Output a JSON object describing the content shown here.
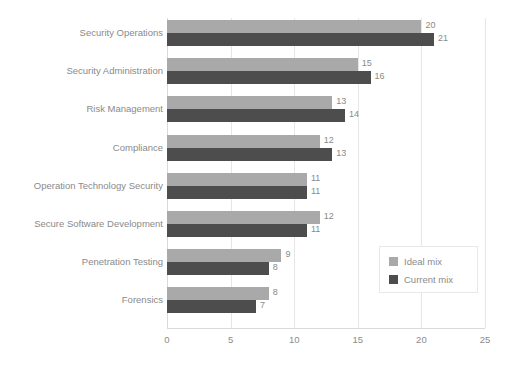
{
  "chart_data": {
    "type": "bar",
    "orientation": "horizontal",
    "title": "",
    "subtitle": "",
    "xlabel": "",
    "ylabel": "",
    "xlim": [
      0,
      25
    ],
    "xticks": [
      "0",
      "5",
      "10",
      "15",
      "20",
      "25"
    ],
    "grid": true,
    "legend_position": "center-right",
    "categories": [
      "Security Operations",
      "Security Administration",
      "Risk Management",
      "Compliance",
      "Operation Technology Security",
      "Secure Software Development",
      "Penetration Testing",
      "Forensics"
    ],
    "series": [
      {
        "name": "Ideal mix",
        "color": "#a9a9a9",
        "values": [
          20,
          15,
          13,
          12,
          11,
          12,
          9,
          8
        ]
      },
      {
        "name": "Current mix",
        "color": "#4d4d4d",
        "values": [
          21,
          16,
          14,
          13,
          11,
          11,
          8,
          7
        ]
      }
    ],
    "data_labels": {
      "Ideal mix": [
        "20",
        "15",
        "13",
        "12",
        "11",
        "12",
        "9",
        "8"
      ],
      "Current mix": [
        "21",
        "16",
        "14",
        "13",
        "11",
        "11",
        "8",
        "7"
      ]
    }
  },
  "legend": {
    "items": [
      {
        "label": "Ideal mix",
        "color": "#a9a9a9"
      },
      {
        "label": "Current mix",
        "color": "#4d4d4d"
      }
    ]
  },
  "colors": {
    "ideal": "#a9a9a9",
    "current": "#4d4d4d",
    "text": "#8a8a8a",
    "grid": "#e6e6e6",
    "background": "#ffffff"
  }
}
